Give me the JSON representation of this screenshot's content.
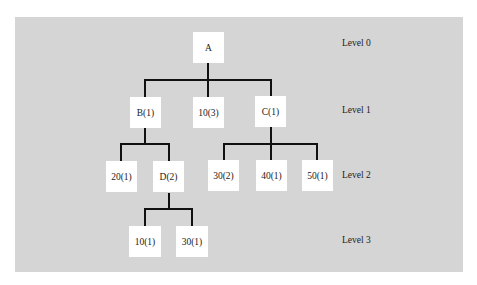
{
  "diagram": {
    "type": "tree",
    "background_color": "#d5d5d5",
    "node_color": "#ffffff",
    "edge_color": "#111111",
    "nodes": [
      {
        "id": "A",
        "label": "A",
        "level": 0
      },
      {
        "id": "B",
        "label": "B(1)",
        "level": 1,
        "parent": "A"
      },
      {
        "id": "n10_3",
        "label": "10(3)",
        "level": 1,
        "parent": "A"
      },
      {
        "id": "C",
        "label": "C(1)",
        "level": 1,
        "parent": "A"
      },
      {
        "id": "n20_1",
        "label": "20(1)",
        "level": 2,
        "parent": "B"
      },
      {
        "id": "D",
        "label": "D(2)",
        "level": 2,
        "parent": "B"
      },
      {
        "id": "n30_2",
        "label": "30(2)",
        "level": 2,
        "parent": "C"
      },
      {
        "id": "n40_1",
        "label": "40(1)",
        "level": 2,
        "parent": "C"
      },
      {
        "id": "n50_1",
        "label": "50(1)",
        "level": 2,
        "parent": "C"
      },
      {
        "id": "n10_1",
        "label": "10(1)",
        "level": 3,
        "parent": "D"
      },
      {
        "id": "n30_1",
        "label": "30(1)",
        "level": 3,
        "parent": "D"
      }
    ],
    "levels": [
      {
        "label": "Level 0"
      },
      {
        "label": "Level 1"
      },
      {
        "label": "Level 2"
      },
      {
        "label": "Level 3"
      }
    ]
  }
}
